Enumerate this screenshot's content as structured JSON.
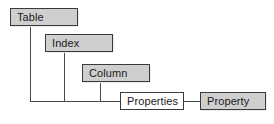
{
  "diagram": {
    "type": "entity-hierarchy",
    "colors": {
      "node_fill": "#cfcfcf",
      "node_fill_hollow": "#ffffff",
      "node_border": "#3a3a3a",
      "connector": "#4a4a4a",
      "text": "#1a1a1a",
      "background": "#ffffff"
    },
    "nodes": [
      {
        "id": "table",
        "label": "Table",
        "style": "filled",
        "x": 10,
        "y": 8,
        "w": 68,
        "h": 18
      },
      {
        "id": "index",
        "label": "Index",
        "style": "filled",
        "x": 45,
        "y": 34,
        "w": 68,
        "h": 18
      },
      {
        "id": "column",
        "label": "Column",
        "style": "filled",
        "x": 82,
        "y": 64,
        "w": 68,
        "h": 18
      },
      {
        "id": "properties",
        "label": "Properties",
        "style": "hollow",
        "x": 120,
        "y": 92,
        "w": 64,
        "h": 18
      },
      {
        "id": "property",
        "label": "Property",
        "style": "filled",
        "x": 200,
        "y": 92,
        "w": 66,
        "h": 18
      }
    ],
    "connectors": [
      {
        "id": "table-drop",
        "orient": "v",
        "x": 30,
        "y": 26,
        "len": 76
      },
      {
        "id": "index-drop",
        "orient": "v",
        "x": 64,
        "y": 52,
        "len": 50
      },
      {
        "id": "column-drop",
        "orient": "v",
        "x": 100,
        "y": 82,
        "len": 20
      },
      {
        "id": "rail-to-properties",
        "orient": "h",
        "x": 30,
        "y": 101,
        "len": 90
      },
      {
        "id": "properties-to-property",
        "orient": "h",
        "x": 184,
        "y": 101,
        "len": 16
      }
    ]
  }
}
